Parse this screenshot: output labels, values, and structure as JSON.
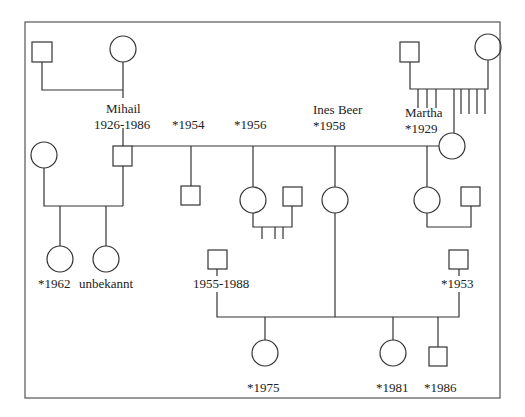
{
  "diagram": {
    "type": "pedigree-chart",
    "stroke_color": "#333333",
    "background": "#ffffff",
    "labels": {
      "mihail_name": "Mihail",
      "mihail_dates": "1926-1986",
      "child_1954": "*1954",
      "child_1956": "*1956",
      "ines_name": "Ines Beer",
      "ines_birth": "*1958",
      "martha_name": "Martha",
      "martha_birth": "*1929",
      "daughter_1962": "*1962",
      "daughter_unknown": "unbekannt",
      "partner_1955_1988": "1955-1988",
      "partner_1953": "*1953",
      "child_1975": "*1975",
      "child_1981": "*1981",
      "child_1986": "*1986"
    },
    "individuals": [
      {
        "id": "mihail-father",
        "sex": "male"
      },
      {
        "id": "mihail-mother",
        "sex": "female"
      },
      {
        "id": "mihail",
        "sex": "male",
        "label": "Mihail 1926-1986"
      },
      {
        "id": "first-wife",
        "sex": "female"
      },
      {
        "id": "daughter-1962",
        "sex": "female",
        "label": "*1962"
      },
      {
        "id": "daughter-unknown",
        "sex": "female",
        "label": "unbekannt"
      },
      {
        "id": "martha-father",
        "sex": "male"
      },
      {
        "id": "martha-mother",
        "sex": "female"
      },
      {
        "id": "martha",
        "sex": "female",
        "label": "Martha *1929"
      },
      {
        "id": "son-1954",
        "sex": "male",
        "label": "*1954"
      },
      {
        "id": "daughter-1956",
        "sex": "female",
        "label": "*1956"
      },
      {
        "id": "partner-1956",
        "sex": "male"
      },
      {
        "id": "ines-beer",
        "sex": "female",
        "label": "Ines Beer *1958"
      },
      {
        "id": "martha-daughter",
        "sex": "female"
      },
      {
        "id": "martha-daughter-partner",
        "sex": "male"
      },
      {
        "id": "partner-1955-1988",
        "sex": "male",
        "label": "1955-1988"
      },
      {
        "id": "partner-1953",
        "sex": "male",
        "label": "*1953"
      },
      {
        "id": "child-1975",
        "sex": "female",
        "label": "*1975"
      },
      {
        "id": "child-1981",
        "sex": "female",
        "label": "*1981"
      },
      {
        "id": "child-1986",
        "sex": "male",
        "label": "*1986"
      }
    ]
  }
}
